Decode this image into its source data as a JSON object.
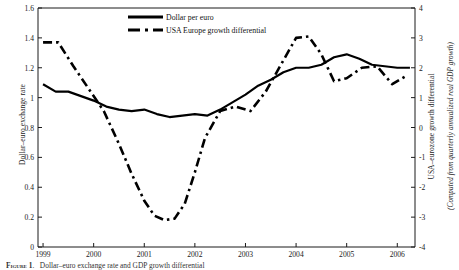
{
  "chart_data": {
    "type": "line",
    "title": "",
    "xlabel": "",
    "ylabel": "Dollar–euro exchange rate",
    "y2label": "USA–eurozone growth differential",
    "y2sublabel": "(Computed from quarterly annualized real GDP growth)",
    "xlim": [
      1998.9,
      2006.35
    ],
    "ylim": [
      0,
      1.6
    ],
    "y2lim": [
      -4,
      4
    ],
    "grid": false,
    "legend_position": "top-center",
    "x_ticks": [
      "1999",
      "2000",
      "2001",
      "2002",
      "2003",
      "2004",
      "2005",
      "2006"
    ],
    "x_tick_values": [
      1999,
      2000,
      2001,
      2002,
      2003,
      2004,
      2005,
      2006
    ],
    "y_ticks": [
      "0",
      "0.2",
      "0.4",
      "0.6",
      "0.8",
      "1",
      "1.2",
      "1.4",
      "1.6"
    ],
    "y_tick_values": [
      0,
      0.2,
      0.4,
      0.6,
      0.8,
      1,
      1.2,
      1.4,
      1.6
    ],
    "y2_ticks": [
      "-4",
      "-3",
      "-2",
      "-1",
      "0",
      "1",
      "2",
      "3",
      "4"
    ],
    "y2_tick_values": [
      -4,
      -3,
      -2,
      -1,
      0,
      1,
      2,
      3,
      4
    ],
    "series": [
      {
        "name": "Dollar per euro",
        "axis": "left",
        "style": "solid",
        "color": "#000000",
        "x": [
          1999.0,
          1999.25,
          1999.5,
          1999.75,
          2000.0,
          2000.25,
          2000.5,
          2000.75,
          2001.0,
          2001.25,
          2001.5,
          2001.75,
          2002.0,
          2002.25,
          2002.5,
          2002.75,
          2003.0,
          2003.25,
          2003.5,
          2003.75,
          2004.0,
          2004.25,
          2004.5,
          2004.75,
          2005.0,
          2005.25,
          2005.5,
          2005.75,
          2006.0,
          2006.25
        ],
        "values": [
          1.09,
          1.04,
          1.04,
          1.01,
          0.98,
          0.94,
          0.92,
          0.91,
          0.92,
          0.89,
          0.87,
          0.88,
          0.89,
          0.88,
          0.92,
          0.97,
          1.02,
          1.08,
          1.12,
          1.17,
          1.2,
          1.2,
          1.22,
          1.27,
          1.29,
          1.26,
          1.22,
          1.21,
          1.2,
          1.2
        ]
      },
      {
        "name": "USA Europe growth differential",
        "axis": "right",
        "style": "dash-dot",
        "color": "#000000",
        "x": [
          1999.0,
          1999.3,
          1999.6,
          1999.9,
          2000.2,
          2000.5,
          2000.75,
          2001.0,
          2001.2,
          2001.4,
          2001.6,
          2001.8,
          2002.0,
          2002.2,
          2002.5,
          2002.8,
          2003.1,
          2003.4,
          2003.7,
          2004.0,
          2004.25,
          2004.5,
          2004.75,
          2005.0,
          2005.3,
          2005.6,
          2005.9,
          2006.2
        ],
        "values": [
          2.85,
          2.85,
          2.05,
          1.3,
          0.55,
          -0.55,
          -1.55,
          -2.45,
          -2.95,
          -3.1,
          -3.05,
          -2.55,
          -1.5,
          -0.35,
          0.55,
          0.7,
          0.55,
          1.2,
          2.1,
          3.0,
          3.05,
          2.45,
          1.55,
          1.65,
          2.0,
          2.05,
          1.45,
          1.75
        ]
      }
    ]
  },
  "legend": {
    "items": [
      {
        "label": "Dollar per euro",
        "style": "solid"
      },
      {
        "label": "USA Europe growth differential",
        "style": "dash-dot"
      }
    ]
  },
  "caption": {
    "number": "Figure 1",
    "text": "Dollar–euro exchange rate and GDP growth differential"
  }
}
